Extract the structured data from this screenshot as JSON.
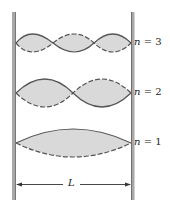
{
  "diagram": {
    "modes": [
      {
        "n": 3,
        "label_var": "n",
        "label_eq": " = 3",
        "y": 43
      },
      {
        "n": 2,
        "label_var": "n",
        "label_eq": " = 2",
        "y": 93
      },
      {
        "n": 1,
        "label_var": "n",
        "label_eq": " = 1",
        "y": 143
      }
    ],
    "length_label": "L",
    "colors": {
      "fill": "#d9d9d9",
      "line": "#555555",
      "wall": "#9a9a9a"
    }
  }
}
